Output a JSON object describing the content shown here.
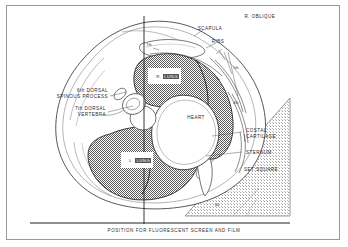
{
  "figure": {
    "view_label": "R. OBLIQUE",
    "caption": "POSITION FOR FLUORESCENT SCREEN AND FILM",
    "angle_label": "60",
    "structures": {
      "scapula": "SCAPULA",
      "ribs": "RIBS",
      "heart": "HEART",
      "costal_cartilage_line1": "COSTAL",
      "costal_cartilage_line2": "CARTILAGE",
      "sternum": "STERNUM",
      "set_square": "SET SQUARE",
      "dorsal_spinous_line1": "6th DORSAL",
      "dorsal_spinous_line2": "SPINOUS PROCESS",
      "dorsal_vertebra_line1": "7th DORSAL",
      "dorsal_vertebra_line2": "VERTEBRA"
    },
    "rib_markers": {
      "seventh": "7th",
      "fifth": "5th",
      "fourth": "4th"
    },
    "lungs": [
      {
        "side": "R.",
        "name": "LUNG"
      },
      {
        "side": "L.",
        "name": "LUNG"
      }
    ],
    "colors": {
      "lung_fill": "#7d7d7d",
      "set_square_fill": "#d8d8d8",
      "outline": "#333333",
      "frame": "#9a9a9a",
      "background": "#ffffff"
    }
  }
}
